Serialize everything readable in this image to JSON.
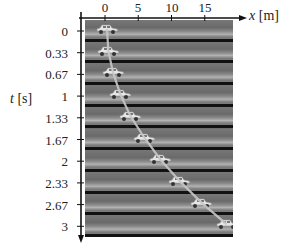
{
  "figure": {
    "x_axis": {
      "label_var": "x",
      "label_unit": "[m]",
      "ticks": [
        "0",
        "5",
        "10",
        "15"
      ]
    },
    "t_axis": {
      "label_var": "t",
      "label_unit": "[s]",
      "ticks": [
        "0",
        "0.33",
        "0.67",
        "1",
        "1.33",
        "1.67",
        "2",
        "2.33",
        "2.67",
        "3"
      ]
    },
    "colors": {
      "road": "#6e6e6e",
      "separator": "#111111",
      "trend_line": "#c8c8c8",
      "car": "#e6e6e6"
    }
  },
  "chart_data": {
    "type": "scatter",
    "title": "",
    "xlabel": "x [m]",
    "ylabel": "t [s]",
    "x_ticks": [
      0,
      5,
      10,
      15
    ],
    "y_ticks": [
      0,
      0.33,
      0.67,
      1,
      1.33,
      1.67,
      2,
      2.33,
      2.67,
      3
    ],
    "points": [
      {
        "t": 0,
        "x": 0.0
      },
      {
        "t": 0.33,
        "x": 0.2
      },
      {
        "t": 0.67,
        "x": 0.9
      },
      {
        "t": 1,
        "x": 2.0
      },
      {
        "t": 1.33,
        "x": 3.5
      },
      {
        "t": 1.67,
        "x": 5.6
      },
      {
        "t": 2,
        "x": 8.0
      },
      {
        "t": 2.33,
        "x": 10.9
      },
      {
        "t": 2.67,
        "x": 14.2
      },
      {
        "t": 3,
        "x": 18.0
      }
    ],
    "xlim": [
      -3,
      19
    ],
    "ylim": [
      3.2,
      -0.1
    ],
    "y_inverted": true,
    "grid": false,
    "annotation": "Line through car positions (parabolic x = 2t^2, constant acceleration)"
  }
}
